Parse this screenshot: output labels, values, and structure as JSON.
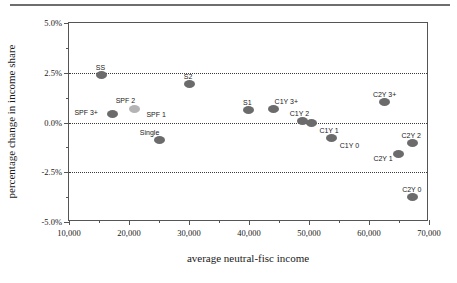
{
  "chart_data": {
    "type": "scatter",
    "title": "",
    "xlabel": "average neutral-fisc income",
    "ylabel": "percentage change in income share",
    "xlim": [
      10000,
      70000
    ],
    "ylim": [
      -5.0,
      5.0
    ],
    "xticks": [
      "10,000",
      "20,000",
      "30,000",
      "40,000",
      "50,000",
      "60,000",
      "70,000"
    ],
    "xtick_values": [
      10000,
      20000,
      30000,
      40000,
      50000,
      60000,
      70000
    ],
    "xminor_values": [
      15000,
      25000,
      35000,
      45000,
      55000,
      65000
    ],
    "yticks": [
      "5.0%",
      "2.5%",
      "0.0%",
      "-2.5%",
      "-5.0%"
    ],
    "ytick_values": [
      5.0,
      2.5,
      0.0,
      -2.5,
      -5.0
    ],
    "yminor_values": [
      3.75,
      1.25,
      -1.25,
      -3.75
    ],
    "gridlines_y": [
      2.5,
      0.0,
      -2.5
    ],
    "grid": "horizontal-dotted",
    "legend": "none",
    "marker_color": "#6b6b6b",
    "marker_color_highlight": "#b4b4b4",
    "points": [
      {
        "label": "SS",
        "x": 15400,
        "y": 2.38,
        "label_dx": -1,
        "label_dy": -11,
        "light": false
      },
      {
        "label": "SPF 3+",
        "x": 17200,
        "y": 0.42,
        "label_dx": -26,
        "label_dy": -5,
        "light": false
      },
      {
        "label": "SPF 2",
        "x": 20900,
        "y": 0.68,
        "label_dx": -9,
        "label_dy": -12,
        "light": true
      },
      {
        "label": "SPF 1",
        "x": 20900,
        "y": 0.68,
        "label_dx": 12,
        "label_dy": 2,
        "light": false,
        "label_only": true
      },
      {
        "label": "Single",
        "x": 25100,
        "y": -0.88,
        "label_dx": -10,
        "label_dy": -11,
        "light": false
      },
      {
        "label": "S2",
        "x": 30000,
        "y": 1.93,
        "label_dx": -1,
        "label_dy": -11,
        "light": false
      },
      {
        "label": "S1",
        "x": 39900,
        "y": 0.62,
        "label_dx": -1,
        "label_dy": -11,
        "light": false
      },
      {
        "label": "C1Y 3+",
        "x": 44100,
        "y": 0.68,
        "label_dx": 1,
        "label_dy": -11,
        "light": false
      },
      {
        "label": "C1Y 2",
        "x": 48900,
        "y": 0.07,
        "label_dx": -3,
        "label_dy": -11,
        "light": false
      },
      {
        "label": "C1Y 1",
        "x": 50400,
        "y": -0.05,
        "label_dx": 8,
        "label_dy": 4,
        "light": false
      },
      {
        "label": "C1Y 0",
        "x": 53800,
        "y": -0.8,
        "label_dx": 8,
        "label_dy": 4,
        "light": false
      },
      {
        "label": "C2Y 3+",
        "x": 62600,
        "y": 1.05,
        "label_dx": 0,
        "label_dy": -11,
        "light": false
      },
      {
        "label": "C2Y 2",
        "x": 67200,
        "y": -1.05,
        "label_dx": -1,
        "label_dy": -11,
        "light": false
      },
      {
        "label": "C2Y 1",
        "x": 64900,
        "y": -1.6,
        "label_dx": -25,
        "label_dy": 1,
        "light": false
      },
      {
        "label": "C2Y 0",
        "x": 67300,
        "y": -3.75,
        "label_dx": -1,
        "label_dy": -11,
        "light": false
      }
    ]
  }
}
